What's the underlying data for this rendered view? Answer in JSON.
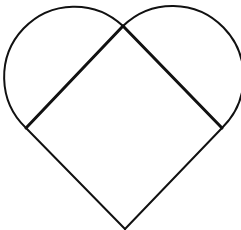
{
  "figure": {
    "background": "#ffffff",
    "stroke_color": "#111111",
    "square": {
      "vertices": {
        "top": [
          123,
          26
        ],
        "left": [
          26,
          128
        ],
        "right": [
          222,
          128
        ],
        "bottom": [
          125,
          229
        ]
      },
      "stroke_width_upper_edges": 3,
      "stroke_width_lower_edges": 2
    },
    "semicircles": [
      {
        "name": "left",
        "from": [
          26,
          128
        ],
        "to": [
          123,
          26
        ],
        "radius": 70
      },
      {
        "name": "right",
        "from": [
          123,
          26
        ],
        "to": [
          222,
          128
        ],
        "radius": 70
      }
    ],
    "arc_stroke_width": 2
  }
}
